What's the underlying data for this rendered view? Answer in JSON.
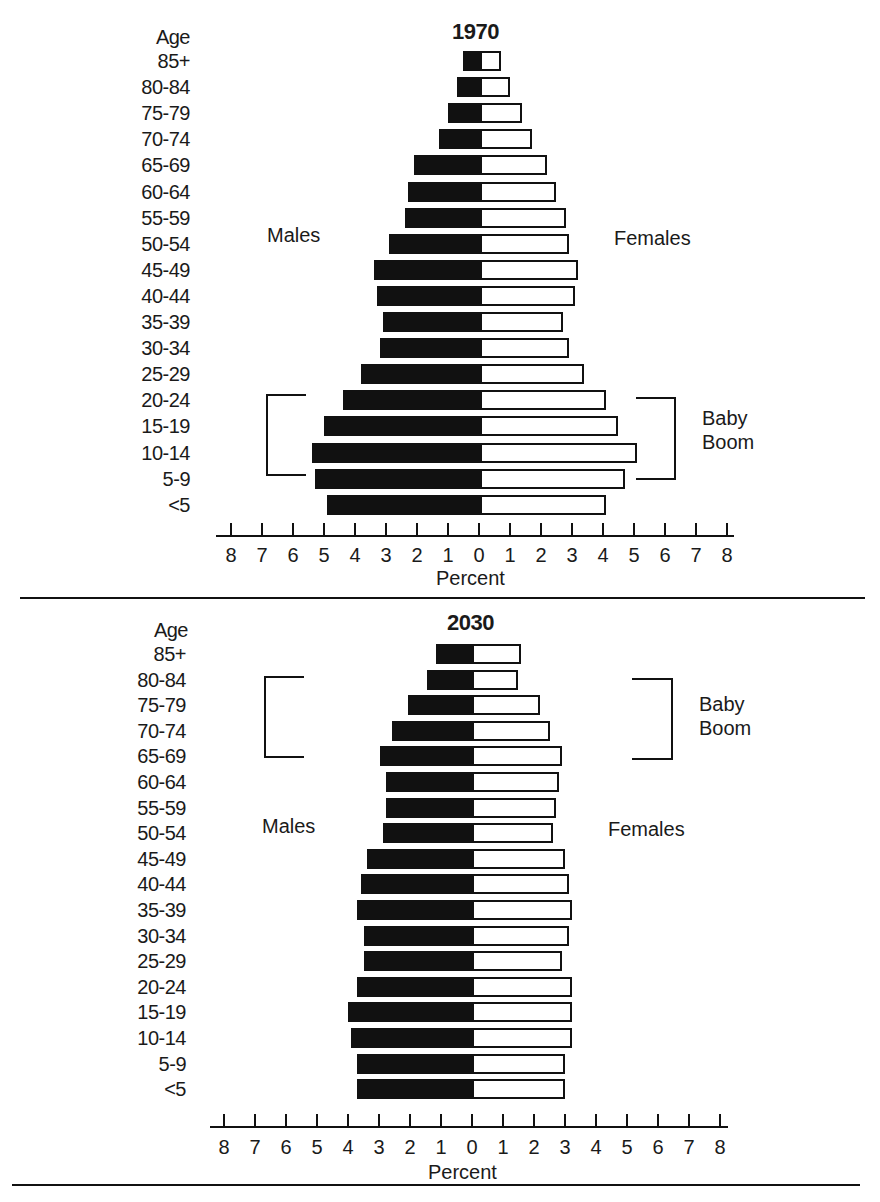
{
  "chart_data": [
    {
      "type": "bar",
      "orientation": "horizontal-population-pyramid",
      "title": "1970",
      "ylabel": "Age",
      "xlabel": "Percent",
      "xlim": [
        -8,
        8
      ],
      "xticks": [
        8,
        7,
        6,
        5,
        4,
        3,
        2,
        1,
        0,
        1,
        2,
        3,
        4,
        5,
        6,
        7,
        8
      ],
      "categories": [
        "85+",
        "80-84",
        "75-79",
        "70-74",
        "65-69",
        "60-64",
        "55-59",
        "50-54",
        "45-49",
        "40-44",
        "35-39",
        "30-34",
        "25-29",
        "20-24",
        "15-19",
        "10-14",
        "5-9",
        "<5"
      ],
      "series": [
        {
          "name": "Males",
          "color": "#111111",
          "values": [
            0.6,
            0.8,
            1.1,
            1.4,
            2.2,
            2.4,
            2.5,
            3.0,
            3.5,
            3.4,
            3.2,
            3.3,
            3.9,
            4.5,
            5.1,
            5.5,
            5.4,
            5.0
          ]
        },
        {
          "name": "Females",
          "color": "#ffffff",
          "values": [
            0.6,
            0.9,
            1.3,
            1.6,
            2.1,
            2.4,
            2.7,
            2.8,
            3.1,
            3.0,
            2.6,
            2.8,
            3.3,
            4.0,
            4.4,
            5.0,
            4.6,
            4.0
          ]
        }
      ],
      "annotations": [
        {
          "text": "Baby Boom",
          "bracket_categories": [
            "20-24",
            "15-19",
            "10-14",
            "5-9"
          ]
        }
      ]
    },
    {
      "type": "bar",
      "orientation": "horizontal-population-pyramid",
      "title": "2030",
      "ylabel": "Age",
      "xlabel": "Percent",
      "xlim": [
        -8,
        8
      ],
      "xticks": [
        8,
        7,
        6,
        5,
        4,
        3,
        2,
        1,
        0,
        1,
        2,
        3,
        4,
        5,
        6,
        7,
        8
      ],
      "categories": [
        "85+",
        "80-84",
        "75-79",
        "70-74",
        "65-69",
        "60-64",
        "55-59",
        "50-54",
        "45-49",
        "40-44",
        "35-39",
        "30-34",
        "25-29",
        "20-24",
        "15-19",
        "10-14",
        "5-9",
        "<5"
      ],
      "series": [
        {
          "name": "Males",
          "color": "#111111",
          "values": [
            1.2,
            1.5,
            2.1,
            2.6,
            3.0,
            2.8,
            2.8,
            2.9,
            3.4,
            3.6,
            3.7,
            3.5,
            3.5,
            3.7,
            4.0,
            3.9,
            3.7,
            3.7
          ]
        },
        {
          "name": "Females",
          "color": "#ffffff",
          "values": [
            1.5,
            1.4,
            2.1,
            2.4,
            2.8,
            2.7,
            2.6,
            2.5,
            2.9,
            3.0,
            3.1,
            3.0,
            2.8,
            3.1,
            3.1,
            3.1,
            2.9,
            2.9
          ]
        }
      ],
      "annotations": [
        {
          "text": "Baby Boom",
          "bracket_categories": [
            "80-84",
            "75-79",
            "70-74",
            "65-69"
          ]
        }
      ]
    }
  ],
  "panels": [
    {
      "title": "1970",
      "age_header": "Age",
      "males_label": "Males",
      "females_label": "Females",
      "baby_boom_line1": "Baby",
      "baby_boom_line2": "Boom",
      "xlabel": "Percent"
    },
    {
      "title": "2030",
      "age_header": "Age",
      "males_label": "Males",
      "females_label": "Females",
      "baby_boom_line1": "Baby",
      "baby_boom_line2": "Boom",
      "xlabel": "Percent"
    }
  ]
}
